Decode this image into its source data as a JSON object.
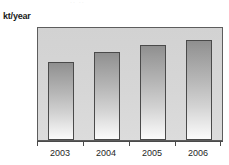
{
  "figure": {
    "cropped_title_remnant": "·· ··",
    "unit_label": "kt/year"
  },
  "chart_data": {
    "type": "bar",
    "title": "",
    "subtitle": "",
    "xlabel": "",
    "ylabel": "kt/year",
    "categories": [
      "2003",
      "2004",
      "2005",
      "2006"
    ],
    "values": [
      1.54,
      1.73,
      1.87,
      1.96
    ],
    "series": [
      {
        "name": "kt/year",
        "values": [
          1.54,
          1.73,
          1.87,
          1.96
        ]
      }
    ],
    "ylim": [
      0,
      2.2
    ],
    "ytick_labels": [
      "1",
      "2"
    ],
    "ytick_values": [
      1,
      2
    ],
    "grid": false,
    "legend": false,
    "legend_position": "none",
    "bar_fill_top_color": "#8f8f8f",
    "bar_fill_bottom_color": "#fbfbfb",
    "bar_outline_color": "#4a4a4a",
    "plot_background_color": "#d6d6d6",
    "axis_color": "#4a4a4a",
    "text_color": "#1f1f1f"
  }
}
